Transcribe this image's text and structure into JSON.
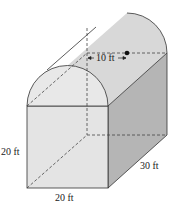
{
  "figure": {
    "labels": {
      "radius": "10 ft",
      "height": "20 ft",
      "width": "20 ft",
      "length": "30 ft"
    },
    "colors": {
      "front_face": "#e6e6e6",
      "side_face": "#b8b8b8",
      "roof": "#d9d9d9",
      "front_arch": "#e9e9e9",
      "stroke": "#333333"
    }
  }
}
